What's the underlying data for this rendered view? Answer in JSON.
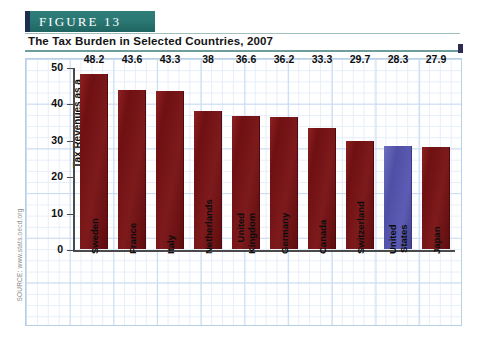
{
  "figure": {
    "banner_label": "FIGURE  13",
    "subtitle": "The Tax Burden in Selected Countries, 2007",
    "source": "SOURCE: www.stats.oecd.org"
  },
  "colors": {
    "banner_teal": "#2b7874",
    "banner_accent": "#1d2d4f",
    "bar_default": "#7b1518",
    "bar_highlight": "#5252ab",
    "grid_minor": "#e6eefa",
    "grid_major": "#c9dcf0",
    "axis": "#4a4a4a"
  },
  "chart_data": {
    "type": "bar",
    "title": "The Tax Burden in Selected Countries, 2007",
    "xlabel": "",
    "ylabel": "Tax Revenues as a Percentage of GDP",
    "ylabel_lines": [
      "Tax Revenues as a",
      "Percentage of GDP"
    ],
    "ylim": [
      0,
      50
    ],
    "yticks": [
      0,
      10,
      20,
      30,
      40,
      50
    ],
    "ytick_labels": [
      "0",
      "10",
      "20",
      "30",
      "40",
      "50"
    ],
    "grid": true,
    "legend": false,
    "categories": [
      "Sweden",
      "France",
      "Italy",
      "Netherlands",
      "United Kingdom",
      "Germany",
      "Canada",
      "Switzerland",
      "United States",
      "Japan"
    ],
    "category_label_lines": [
      [
        "Sweden"
      ],
      [
        "France"
      ],
      [
        "Italy"
      ],
      [
        "Netherlands"
      ],
      [
        "United",
        "Kingdom"
      ],
      [
        "Germany"
      ],
      [
        "Canada"
      ],
      [
        "Switzerland"
      ],
      [
        "United",
        "States"
      ],
      [
        "Japan"
      ]
    ],
    "values": [
      48.2,
      43.6,
      43.3,
      38,
      36.6,
      36.2,
      33.3,
      29.7,
      28.3,
      27.9
    ],
    "value_labels": [
      "48.2",
      "43.6",
      "43.3",
      "38",
      "36.6",
      "36.2",
      "33.3",
      "29.7",
      "28.3",
      "27.9"
    ],
    "highlighted_index": 8,
    "highlighted_category": "United States"
  }
}
